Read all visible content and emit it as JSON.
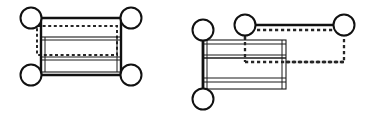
{
  "figure": {
    "title": "Two mechanism linkage diagrams",
    "background_color": "#ffffff",
    "stroke_color": "#111111",
    "dash_color": "#262626",
    "width": 371,
    "height": 118,
    "panels": [
      {
        "id": "left-panel",
        "name": "aligned-four-bar-linkage",
        "label": "",
        "origin_x": 0,
        "origin_y": 0,
        "nodes": [
          {
            "name": "joint-top-left",
            "cx": 31,
            "cy": 18,
            "r": 10.5,
            "stroke_width": 2.0
          },
          {
            "name": "joint-top-right",
            "cx": 131,
            "cy": 18,
            "r": 10.5,
            "stroke_width": 2.0
          },
          {
            "name": "joint-bottom-left",
            "cx": 31,
            "cy": 75,
            "r": 10.5,
            "stroke_width": 2.0
          },
          {
            "name": "joint-bottom-right",
            "cx": 131,
            "cy": 75,
            "r": 10.5,
            "stroke_width": 2.0
          }
        ],
        "solid_links": [
          {
            "name": "link-top-bar",
            "x1": 41,
            "y1": 18,
            "x2": 121,
            "y2": 18,
            "stroke_width": 2.6
          },
          {
            "name": "link-bottom-bar",
            "x1": 41,
            "y1": 75,
            "x2": 121,
            "y2": 75,
            "stroke_width": 2.6
          },
          {
            "name": "link-left-post",
            "x1": 41,
            "y1": 28,
            "x2": 41,
            "y2": 66,
            "stroke_width": 2.6
          },
          {
            "name": "link-right-post",
            "x1": 121,
            "y1": 28,
            "x2": 121,
            "y2": 66,
            "stroke_width": 2.6
          }
        ],
        "body_rect": {
          "name": "slider-body",
          "x": 41,
          "y": 37,
          "width": 80,
          "height": 35,
          "stroke_width": 1.1
        },
        "body_rules": [
          {
            "name": "body-rule-upper",
            "x1": 41,
            "y1": 40,
            "x2": 121,
            "y2": 40,
            "stroke_width": 1.0
          },
          {
            "name": "body-rule-middle",
            "x1": 41,
            "y1": 57,
            "x2": 121,
            "y2": 57,
            "stroke_width": 1.0
          },
          {
            "name": "body-rule-lower",
            "x1": 41,
            "y1": 60,
            "x2": 121,
            "y2": 60,
            "stroke_width": 1.0
          }
        ],
        "body_verticals": [
          {
            "name": "body-left-edge-inner",
            "x1": 45,
            "y1": 37,
            "x2": 45,
            "y2": 72,
            "stroke_width": 1.0
          },
          {
            "name": "body-right-edge-inner",
            "x1": 117,
            "y1": 37,
            "x2": 117,
            "y2": 72,
            "stroke_width": 1.0
          }
        ],
        "dashed_rect": {
          "name": "phantom-outline",
          "x": 37,
          "y": 26,
          "width": 80,
          "height": 29,
          "stroke_width": 2.0,
          "dash_pattern": "3 2.6"
        }
      },
      {
        "id": "right-panel",
        "name": "offset-four-bar-linkage",
        "label": "",
        "origin_x": 186,
        "origin_y": 0,
        "nodes": [
          {
            "name": "joint-left-upper",
            "cx": 203,
            "cy": 30,
            "r": 10.5,
            "stroke_width": 2.0
          },
          {
            "name": "joint-mid-upper",
            "cx": 245,
            "cy": 25,
            "r": 10.5,
            "stroke_width": 2.0
          },
          {
            "name": "joint-right-upper",
            "cx": 344,
            "cy": 25,
            "r": 10.5,
            "stroke_width": 2.0
          },
          {
            "name": "joint-left-lower",
            "cx": 203,
            "cy": 99,
            "r": 10.5,
            "stroke_width": 2.0
          }
        ],
        "solid_links": [
          {
            "name": "link-upper-bar",
            "x1": 255,
            "y1": 25,
            "x2": 334,
            "y2": 25,
            "stroke_width": 2.6
          },
          {
            "name": "link-left-post",
            "x1": 203,
            "y1": 40,
            "x2": 203,
            "y2": 89,
            "stroke_width": 2.8
          }
        ],
        "body_rect": {
          "name": "slider-body",
          "x": 203,
          "y": 40,
          "width": 83,
          "height": 49,
          "stroke_width": 1.1
        },
        "body_rules": [
          {
            "name": "body-rule-1",
            "x1": 203,
            "y1": 44,
            "x2": 286,
            "y2": 44,
            "stroke_width": 1.0
          },
          {
            "name": "body-rule-2",
            "x1": 203,
            "y1": 55,
            "x2": 286,
            "y2": 55,
            "stroke_width": 1.0
          },
          {
            "name": "body-rule-3",
            "x1": 203,
            "y1": 58,
            "x2": 286,
            "y2": 58,
            "stroke_width": 1.3
          },
          {
            "name": "body-rule-4",
            "x1": 203,
            "y1": 78,
            "x2": 286,
            "y2": 78,
            "stroke_width": 1.0
          },
          {
            "name": "body-rule-5",
            "x1": 203,
            "y1": 82,
            "x2": 286,
            "y2": 82,
            "stroke_width": 1.0
          }
        ],
        "body_verticals": [
          {
            "name": "body-left-edge-inner",
            "x1": 207,
            "y1": 40,
            "x2": 207,
            "y2": 89,
            "stroke_width": 1.0
          },
          {
            "name": "body-right-edge-inner",
            "x1": 282,
            "y1": 40,
            "x2": 282,
            "y2": 89,
            "stroke_width": 1.0
          }
        ],
        "dashed_rect": {
          "name": "phantom-outline",
          "x": 245,
          "y": 30,
          "width": 99,
          "height": 32,
          "stroke_width": 2.3,
          "dash_pattern": "3.2 2.8"
        }
      }
    ]
  }
}
